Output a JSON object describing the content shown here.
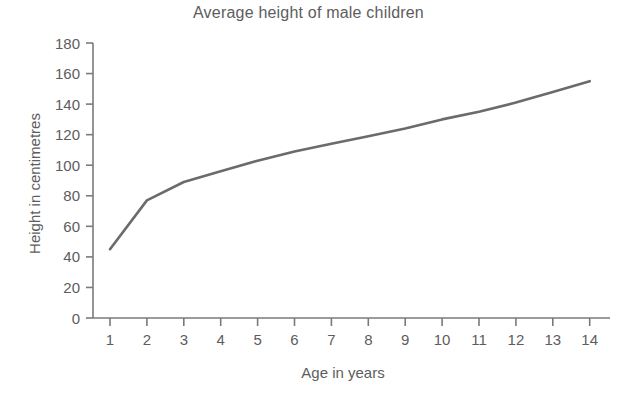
{
  "chart_data": {
    "type": "line",
    "title": "Average height of male children",
    "xlabel": "Age in years",
    "ylabel": "Height in centimetres",
    "x": [
      1,
      2,
      3,
      4,
      5,
      6,
      7,
      8,
      9,
      10,
      11,
      12,
      13,
      14
    ],
    "values": [
      45,
      77,
      89,
      96,
      103,
      109,
      114,
      119,
      124,
      130,
      135,
      141,
      148,
      155
    ],
    "series": [
      {
        "name": "Average height",
        "values": [
          45,
          77,
          89,
          96,
          103,
          109,
          114,
          119,
          124,
          130,
          135,
          141,
          148,
          155
        ]
      }
    ],
    "xlim": [
      0.6,
      14.6
    ],
    "ylim": [
      0,
      180
    ],
    "xticks": [
      "1",
      "2",
      "3",
      "4",
      "5",
      "6",
      "7",
      "8",
      "9",
      "10",
      "11",
      "12",
      "13",
      "14"
    ],
    "yticks": [
      "0",
      "20",
      "40",
      "60",
      "80",
      "100",
      "120",
      "140",
      "160",
      "180"
    ],
    "grid": false,
    "legend": false,
    "legend_position": "none",
    "line_color": "#6b6b6b",
    "axis_color": "#7a7a7a",
    "text_color": "#5d5d5d",
    "background_color": "#ffffff"
  }
}
